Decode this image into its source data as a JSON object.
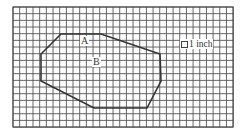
{
  "diagram": {
    "type": "grid-polygon",
    "grid": {
      "x0": 13,
      "y0": 7,
      "cols": 33,
      "rows": 18,
      "cell": 6.67,
      "line_color": "#555555",
      "border_color": "#444444"
    },
    "polygon": {
      "stroke": "#333333",
      "points": [
        [
          61,
          34
        ],
        [
          101,
          34
        ],
        [
          160,
          54
        ],
        [
          161,
          81
        ],
        [
          147,
          108
        ],
        [
          94,
          108
        ],
        [
          41,
          81
        ],
        [
          41,
          54
        ]
      ]
    },
    "labels": {
      "a": "A",
      "b": "B"
    },
    "scale": {
      "label": "1 inch",
      "icon": "square-unit-icon"
    }
  }
}
